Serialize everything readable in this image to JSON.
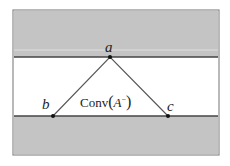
{
  "figure": {
    "type": "convex hull diagram",
    "colors": {
      "band": "#c4c4c4",
      "line": "#555555",
      "background": "#ffffff"
    },
    "points": [
      {
        "label": "a",
        "x": 110,
        "y": 57
      },
      {
        "label": "b",
        "x": 53,
        "y": 116
      },
      {
        "label": "c",
        "x": 168,
        "y": 116
      }
    ],
    "region_label": {
      "prefix": "Conv",
      "open": "(",
      "set": "A",
      "sup": "−",
      "close": ")"
    }
  }
}
